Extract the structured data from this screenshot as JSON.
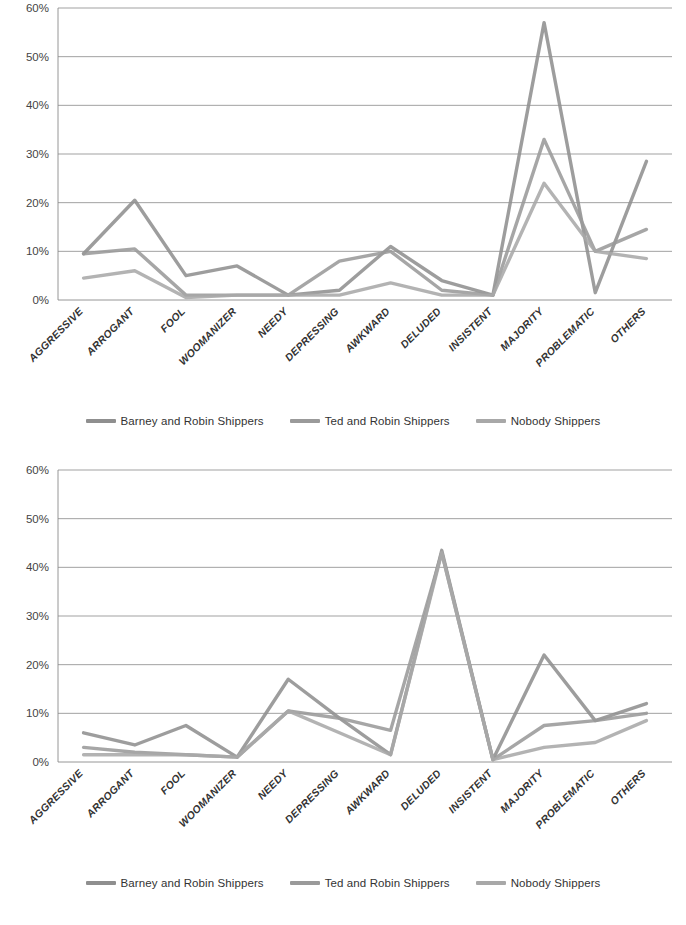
{
  "document": {
    "kind": "scanned-figure-pair",
    "background_color": "#ffffff"
  },
  "axis": {
    "y_ticks": [
      "60%",
      "50%",
      "40%",
      "30%",
      "20%",
      "10%",
      "0%"
    ],
    "y_min": 0,
    "y_max": 60,
    "y_step": 10,
    "grid": "horizontal"
  },
  "categories": [
    "AGGRESSIVE",
    "ARROGANT",
    "FOOL",
    "WOOMANIZER",
    "NEEDY",
    "DEPRESSING",
    "AWKWARD",
    "DELUDED",
    "INSISTENT",
    "MAJORITY",
    "PROBLEMATIC",
    "OTHERS"
  ],
  "legend": {
    "position": "bottom",
    "items": [
      {
        "label": "Barney and Robin Shippers",
        "color": "#8f8f8f"
      },
      {
        "label": "Ted and Robin Shippers",
        "color": "#9a9a9a"
      },
      {
        "label": "Nobody Shippers",
        "color": "#a8a8a8"
      }
    ]
  },
  "chart_data": [
    {
      "type": "line",
      "title": "",
      "subtitle": "",
      "xlabel": "",
      "ylabel": "",
      "ylim": [
        0,
        60
      ],
      "y_ticks": [
        0,
        10,
        20,
        30,
        40,
        50,
        60
      ],
      "grid": true,
      "legend_position": "bottom",
      "categories": [
        "AGGRESSIVE",
        "ARROGANT",
        "FOOL",
        "WOOMANIZER",
        "NEEDY",
        "DEPRESSING",
        "AWKWARD",
        "DELUDED",
        "INSISTENT",
        "MAJORITY",
        "PROBLEMATIC",
        "OTHERS"
      ],
      "series": [
        {
          "name": "Barney and Robin Shippers",
          "color": "#8f8f8f",
          "values": [
            9.5,
            20.5,
            5,
            7,
            1,
            2,
            11,
            4,
            1,
            57,
            1.5,
            28.5
          ]
        },
        {
          "name": "Ted and Robin Shippers",
          "color": "#9a9a9a",
          "values": [
            9.5,
            10.5,
            1,
            1,
            1,
            8,
            10,
            2,
            1,
            33,
            10,
            14.5
          ]
        },
        {
          "name": "Nobody Shippers",
          "color": "#a8a8a8",
          "values": [
            4.5,
            6,
            0.5,
            1,
            1,
            1,
            3.5,
            1,
            1,
            24,
            10,
            8.5
          ]
        }
      ]
    },
    {
      "type": "line",
      "title": "",
      "subtitle": "",
      "xlabel": "",
      "ylabel": "",
      "ylim": [
        0,
        60
      ],
      "y_ticks": [
        0,
        10,
        20,
        30,
        40,
        50,
        60
      ],
      "grid": true,
      "legend_position": "bottom",
      "categories": [
        "AGGRESSIVE",
        "ARROGANT",
        "FOOL",
        "WOOMANIZER",
        "NEEDY",
        "DEPRESSING",
        "AWKWARD",
        "DELUDED",
        "INSISTENT",
        "MAJORITY",
        "PROBLEMATIC",
        "OTHERS"
      ],
      "series": [
        {
          "name": "Barney and Robin Shippers",
          "color": "#8f8f8f",
          "values": [
            6,
            3.5,
            7.5,
            1,
            17,
            9,
            1.5,
            43.5,
            0.5,
            22,
            8.5,
            12
          ]
        },
        {
          "name": "Ted and Robin Shippers",
          "color": "#9a9a9a",
          "values": [
            3,
            2,
            1.5,
            1,
            10.5,
            9,
            6.5,
            43,
            0.5,
            7.5,
            8.5,
            10
          ]
        },
        {
          "name": "Nobody Shippers",
          "color": "#a8a8a8",
          "values": [
            1.5,
            1.5,
            1.5,
            1,
            10.5,
            6,
            1.5,
            43,
            0.5,
            3,
            4,
            8.5
          ]
        }
      ]
    }
  ]
}
